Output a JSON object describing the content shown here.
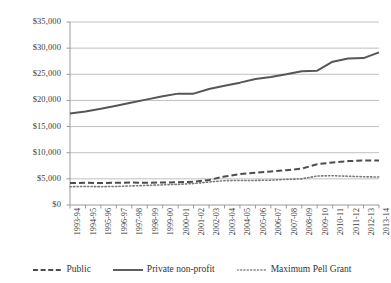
{
  "chart_data": {
    "type": "line",
    "title": "",
    "subtitle": "",
    "xlabel": "",
    "ylabel": "",
    "grid": true,
    "legend_position": "bottom",
    "ylim": [
      0,
      35000
    ],
    "ytick_step": 5000,
    "ytick_labels": [
      "$0",
      "$5,000",
      "$10,000",
      "$15,000",
      "$20,000",
      "$25,000",
      "$30,000",
      "$35,000"
    ],
    "ytick_values": [
      0,
      5000,
      10000,
      15000,
      20000,
      25000,
      30000,
      35000
    ],
    "categories": [
      "1993-94",
      "1994-95",
      "1995-96",
      "1996-97",
      "1997-98",
      "1998-99",
      "1999-00",
      "2000-01",
      "2001-02",
      "2002-03",
      "2003-04",
      "2004-05",
      "2005-06",
      "2006-07",
      "2007-08",
      "2008-09",
      "2009-10",
      "2010-11",
      "2011-12",
      "2012-13",
      "2013-14"
    ],
    "series": [
      {
        "name": "Public",
        "style": "dashed",
        "color": "#4d4d4d",
        "values": [
          4200,
          4250,
          4200,
          4250,
          4300,
          4250,
          4300,
          4350,
          4450,
          4800,
          5450,
          5900,
          6150,
          6400,
          6650,
          6950,
          7800,
          8150,
          8400,
          8500,
          8500
        ]
      },
      {
        "name": "Private non-profit",
        "style": "solid",
        "color": "#565656",
        "values": [
          17500,
          17900,
          18400,
          19000,
          19600,
          20200,
          20800,
          21300,
          21300,
          22200,
          22800,
          23400,
          24100,
          24500,
          25000,
          25600,
          25700,
          27400,
          28000,
          28100,
          29200
        ]
      },
      {
        "name": "Maximum Pell Grant",
        "style": "dotted",
        "color": "#7a7a7a",
        "values": [
          3500,
          3550,
          3500,
          3550,
          3650,
          3750,
          3850,
          3950,
          4100,
          4400,
          4650,
          4700,
          4700,
          4750,
          4900,
          5000,
          5550,
          5600,
          5500,
          5400,
          5350
        ]
      }
    ]
  },
  "legend": {
    "items": [
      {
        "label": "Public",
        "swatch": "dashed-line-icon"
      },
      {
        "label": "Private non-profit",
        "swatch": "solid-line-icon"
      },
      {
        "label": "Maximum Pell Grant",
        "swatch": "dotted-line-icon"
      }
    ]
  }
}
